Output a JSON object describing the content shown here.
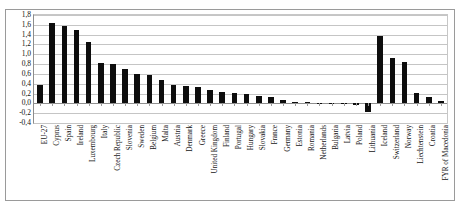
{
  "figure": {
    "top_ghost_text": "",
    "background_color": "#ffffff",
    "bar_color": "#0d0d0d",
    "grid_color": "#c5c5c5",
    "frame_color": "#9a9a9a"
  },
  "chart_data": {
    "type": "bar",
    "title": "",
    "xlabel": "",
    "ylabel": "",
    "ylim": [
      -0.4,
      1.8
    ],
    "ytick_step": 0.2,
    "yticks": [
      1.8,
      1.6,
      1.4,
      1.2,
      1.0,
      0.8,
      0.6,
      0.4,
      0.2,
      0.0,
      -0.2,
      -0.4
    ],
    "ytick_labels": [
      "1,8",
      "1,6",
      "1,4",
      "1,2",
      "1,0",
      "0,8",
      "0,6",
      "0,4",
      "0,2",
      "0,0",
      "-0,2",
      "-0,4"
    ],
    "grid": true,
    "legend": false,
    "categories": [
      "EU-27",
      "Cyprus",
      "Spain",
      "Ireland",
      "Luxembourg",
      "Italy",
      "Czech Republic",
      "Slovenia",
      "Sweden",
      "Belgium",
      "Malta",
      "Austria",
      "Denmark",
      "Greece",
      "United Kingdom",
      "Finland",
      "Portugal",
      "Hungary",
      "Slovakia",
      "France",
      "Germany",
      "Estonia",
      "Romania",
      "Netherlands",
      "Bulgaria",
      "Latvia",
      "Poland",
      "Lithuania",
      "Iceland",
      "Switzerland",
      "Norway",
      "Liechtenstein",
      "Croatia",
      "FYR of Macedonia"
    ],
    "values": [
      0.38,
      1.63,
      1.57,
      1.5,
      1.25,
      0.82,
      0.8,
      0.69,
      0.59,
      0.58,
      0.48,
      0.37,
      0.35,
      0.34,
      0.27,
      0.24,
      0.21,
      0.19,
      0.16,
      0.12,
      0.06,
      0.03,
      0.02,
      0.01,
      0.0,
      -0.01,
      -0.03,
      -0.18,
      1.38,
      0.92,
      0.85,
      0.22,
      0.13,
      0.04
    ]
  }
}
